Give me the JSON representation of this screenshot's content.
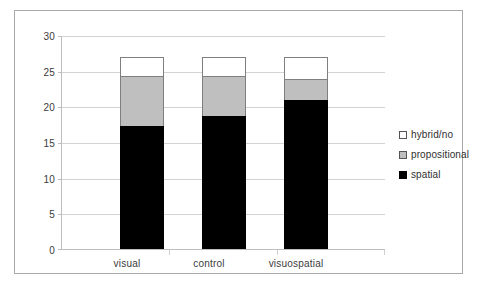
{
  "chart_data": {
    "type": "bar",
    "stacked": true,
    "title": "",
    "subtitle": "",
    "xlabel": "",
    "ylabel": "",
    "categories": [
      "visual",
      "control",
      "visuospatial"
    ],
    "series": [
      {
        "name": "spatial",
        "color": "#000000",
        "values": [
          17.3,
          18.8,
          21.0
        ]
      },
      {
        "name": "propositional",
        "color": "#bfbfbf",
        "values": [
          7.0,
          5.5,
          3.0
        ]
      },
      {
        "name": "hybrid/no",
        "color": "#ffffff",
        "values": [
          2.7,
          2.7,
          3.0
        ]
      }
    ],
    "totals": [
      27,
      27,
      27
    ],
    "ylim": [
      0,
      30
    ],
    "ytick_values": [
      0,
      5,
      10,
      15,
      20,
      25,
      30
    ],
    "ytick_labels": [
      "0",
      "5",
      "10",
      "15",
      "20",
      "25",
      "30"
    ],
    "grid": true,
    "legend_position": "right",
    "legend_order": [
      "hybrid/no",
      "propositional",
      "spatial"
    ]
  },
  "legend": {
    "items": [
      {
        "label": "hybrid/no",
        "swatch": "legend-swatch-hybrid"
      },
      {
        "label": "propositional",
        "swatch": "legend-swatch-propositional"
      },
      {
        "label": "spatial",
        "swatch": "legend-swatch-spatial"
      }
    ]
  }
}
